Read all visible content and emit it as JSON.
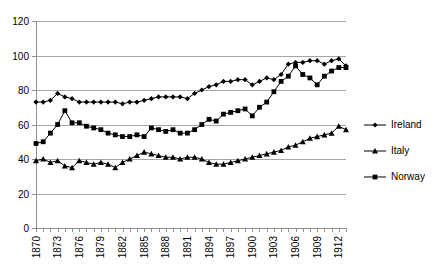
{
  "chart_data": {
    "type": "line",
    "title": "",
    "xlabel": "",
    "ylabel": "",
    "ylim": [
      0,
      120
    ],
    "ytick_values": [
      0,
      20,
      40,
      60,
      80,
      100,
      120
    ],
    "ytick_labels": [
      "0",
      "20",
      "40",
      "60",
      "80",
      "100",
      "120"
    ],
    "grid": true,
    "grid_axis": "y",
    "legend_position": "right",
    "xlim": [
      1870,
      1913
    ],
    "x": [
      1870,
      1871,
      1872,
      1873,
      1874,
      1875,
      1876,
      1877,
      1878,
      1879,
      1880,
      1881,
      1882,
      1883,
      1884,
      1885,
      1886,
      1887,
      1888,
      1889,
      1890,
      1891,
      1892,
      1893,
      1894,
      1895,
      1896,
      1897,
      1898,
      1899,
      1900,
      1901,
      1902,
      1903,
      1904,
      1905,
      1906,
      1907,
      1908,
      1909,
      1910,
      1911,
      1912,
      1913
    ],
    "xtick_labels": [
      "1870",
      "1873",
      "1876",
      "1879",
      "1882",
      "1885",
      "1888",
      "1891",
      "1894",
      "1897",
      "1900",
      "1903",
      "1906",
      "1909",
      "1912"
    ],
    "xtick_values": [
      1870,
      1873,
      1876,
      1879,
      1882,
      1885,
      1888,
      1891,
      1894,
      1897,
      1900,
      1903,
      1906,
      1909,
      1912
    ],
    "series": [
      {
        "name": "Ireland",
        "marker": "diamond",
        "values": [
          73,
          73,
          74,
          78,
          76,
          75,
          73,
          73,
          73,
          73,
          73,
          73,
          72,
          73,
          73,
          74,
          75,
          76,
          76,
          76,
          76,
          75,
          78,
          80,
          82,
          83,
          85,
          85,
          86,
          86,
          83,
          85,
          87,
          86,
          89,
          95,
          96,
          96,
          97,
          97,
          95,
          97,
          98,
          94
        ]
      },
      {
        "name": "Italy",
        "marker": "triangle",
        "values": [
          39,
          40,
          38,
          39,
          36,
          35,
          39,
          38,
          37,
          38,
          37,
          35,
          38,
          40,
          42,
          44,
          43,
          42,
          41,
          41,
          40,
          41,
          41,
          40,
          38,
          37,
          37,
          38,
          39,
          40,
          41,
          42,
          43,
          44,
          45,
          47,
          48,
          50,
          52,
          53,
          54,
          55,
          59,
          57
        ]
      },
      {
        "name": "Norway",
        "marker": "square",
        "values": [
          49,
          50,
          55,
          60,
          68,
          61,
          61,
          59,
          58,
          57,
          55,
          54,
          53,
          53,
          54,
          53,
          58,
          57,
          56,
          57,
          55,
          55,
          57,
          60,
          63,
          62,
          66,
          67,
          68,
          69,
          65,
          70,
          73,
          79,
          85,
          88,
          94,
          89,
          87,
          83,
          88,
          91,
          93,
          93
        ]
      }
    ]
  },
  "legend": {
    "entries": [
      {
        "label": "Ireland"
      },
      {
        "label": "Italy"
      },
      {
        "label": "Norway"
      }
    ]
  }
}
